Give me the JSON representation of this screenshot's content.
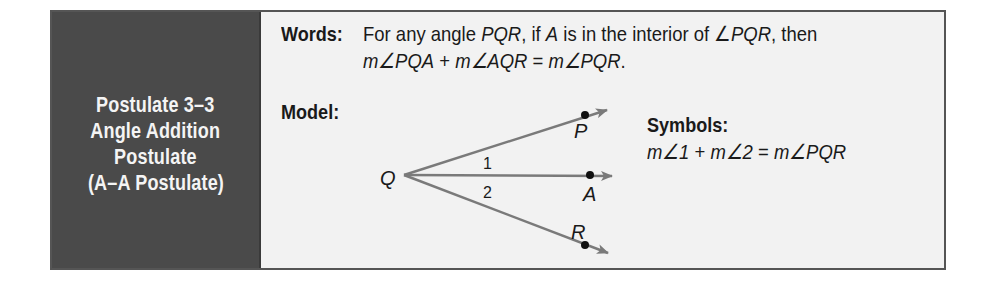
{
  "title_panel": {
    "lines": [
      "Postulate 3–3",
      "Angle Addition",
      "Postulate",
      "(A–A Postulate)"
    ],
    "background_color": "#4a4a4a",
    "text_color": "#f4f4f4"
  },
  "words": {
    "label": "Words:",
    "line1": {
      "t1": "For any angle ",
      "pqr1": "PQR",
      "t2": ", if ",
      "a": "A",
      "t3": " is in the interior of ",
      "angle": "∠",
      "pqr2": "PQR",
      "t4": ", then"
    },
    "line2": {
      "m1": "m∠PQA",
      "plus": " + ",
      "m2": "m∠AQR",
      "eq": " = ",
      "m3": "m∠PQR",
      "end": "."
    }
  },
  "model": {
    "label": "Model:",
    "diagram": {
      "vertex_label": "Q",
      "ray_labels": [
        "P",
        "A",
        "R"
      ],
      "angle_labels": [
        "1",
        "2"
      ],
      "ray_color": "#7a7a7a",
      "point_color": "#111111"
    }
  },
  "symbols": {
    "label": "Symbols:",
    "equation": {
      "m1": "m∠1",
      "plus": " + ",
      "m2": "m∠2",
      "eq": " = ",
      "m3": "m∠PQR"
    }
  }
}
